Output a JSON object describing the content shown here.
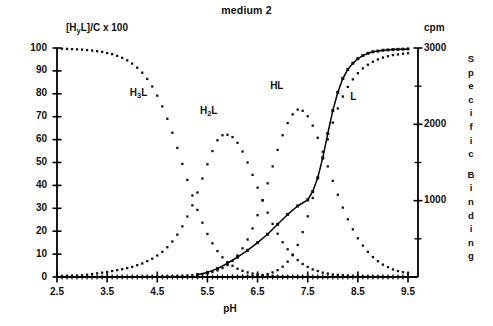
{
  "chart_data": {
    "type": "scatter",
    "title": "medium 2",
    "xlabel": "pH",
    "ylabel": "[HyL]/C x 100",
    "ylabel_parts": {
      "pre": "[H",
      "sub": "y",
      "post": "L]/C x 100"
    },
    "y2label": "cpm",
    "y2_vertical_label": "Specific Binding",
    "y2_vertical_chars": [
      "S",
      "p",
      "e",
      "c",
      "i",
      "f",
      "i",
      "c",
      "",
      "B",
      "i",
      "n",
      "d",
      "i",
      "n",
      "g"
    ],
    "xlim": [
      2.5,
      9.5
    ],
    "ylim": [
      0,
      100
    ],
    "y2lim": [
      0,
      3000
    ],
    "xticks": [
      2.5,
      3.5,
      4.5,
      5.5,
      6.5,
      7.5,
      8.5,
      9.5
    ],
    "xtick_labels": [
      "2.5",
      "3.5",
      "4.5",
      "5.5",
      "6.5",
      "7.5",
      "8.5",
      "9.5"
    ],
    "x_minor_tick_step": 0.1,
    "yticks": [
      0,
      10,
      20,
      30,
      40,
      50,
      60,
      70,
      80,
      90,
      100
    ],
    "ytick_labels": [
      "0",
      "10",
      "20",
      "30",
      "40",
      "50",
      "60",
      "70",
      "80",
      "90",
      "100"
    ],
    "y2ticks": [
      1000,
      2000,
      3000
    ],
    "y2tick_labels": [
      "1000",
      "2000",
      "3000"
    ],
    "y2_minor_ticks": [
      500,
      1500,
      2500
    ],
    "grid": false,
    "legend_position": "inline-annotations",
    "marker": "square-dot",
    "series": [
      {
        "name": "H3L",
        "label_parts": {
          "pre": "H",
          "sub": "3",
          "post": "L"
        },
        "label_x": 4.15,
        "label_y": 80,
        "style": "dotted",
        "axis": "left",
        "x": [
          2.5,
          2.6,
          2.7,
          2.8,
          2.9,
          3.0,
          3.1,
          3.2,
          3.3,
          3.4,
          3.5,
          3.6,
          3.7,
          3.8,
          3.9,
          4.0,
          4.1,
          4.2,
          4.3,
          4.4,
          4.5,
          4.6,
          4.7,
          4.8,
          4.9,
          5.0,
          5.1,
          5.2,
          5.3,
          5.4,
          5.5,
          5.6,
          5.7,
          5.8,
          5.9,
          6.0,
          6.1,
          6.2,
          6.3,
          6.4,
          6.5,
          6.6,
          6.7,
          6.8,
          6.9,
          7.0,
          7.2,
          7.4,
          7.6,
          7.8,
          8.0,
          8.5,
          9.0,
          9.5
        ],
        "y": [
          99.7,
          99.7,
          99.6,
          99.5,
          99.4,
          99.3,
          99.1,
          98.9,
          98.6,
          98.3,
          97.8,
          97.3,
          96.6,
          95.7,
          94.6,
          93.2,
          91.4,
          89.2,
          86.5,
          83.2,
          79.2,
          74.5,
          69.1,
          63.0,
          56.4,
          49.4,
          42.4,
          35.6,
          29.3,
          23.7,
          18.8,
          14.7,
          11.3,
          8.6,
          6.5,
          4.9,
          3.6,
          2.7,
          2.0,
          1.5,
          1.1,
          0.8,
          0.6,
          0.4,
          0.3,
          0.2,
          0.1,
          0.1,
          0.0,
          0.0,
          0.0,
          0.0,
          0.0,
          0.0
        ]
      },
      {
        "name": "H2L",
        "label_parts": {
          "pre": "H",
          "sub": "2",
          "post": "L"
        },
        "label_x": 5.55,
        "label_y": 72,
        "style": "dotted",
        "axis": "left",
        "x": [
          2.5,
          3.0,
          3.5,
          3.8,
          4.0,
          4.2,
          4.4,
          4.5,
          4.6,
          4.7,
          4.8,
          4.9,
          5.0,
          5.1,
          5.2,
          5.3,
          5.4,
          5.5,
          5.6,
          5.7,
          5.8,
          5.9,
          6.0,
          6.1,
          6.2,
          6.3,
          6.4,
          6.5,
          6.6,
          6.7,
          6.8,
          6.9,
          7.0,
          7.1,
          7.2,
          7.3,
          7.4,
          7.5,
          7.6,
          7.8,
          8.0,
          8.5,
          9.0,
          9.5
        ],
        "y": [
          0.3,
          0.7,
          2.2,
          3.4,
          4.4,
          5.9,
          8.0,
          9.4,
          11.0,
          13.0,
          15.5,
          18.5,
          22.1,
          26.4,
          31.3,
          36.9,
          43.0,
          49.2,
          55.0,
          59.7,
          61.9,
          62.1,
          61.1,
          58.6,
          54.8,
          50.0,
          44.6,
          39.0,
          33.4,
          28.1,
          23.2,
          18.9,
          15.2,
          12.1,
          9.5,
          7.4,
          5.7,
          4.4,
          3.3,
          1.9,
          1.1,
          0.3,
          0.1,
          0.0
        ]
      },
      {
        "name": "HL",
        "label_parts": {
          "pre": "HL",
          "sub": "",
          "post": ""
        },
        "label_x": 6.95,
        "label_y": 83,
        "style": "dotted",
        "axis": "left",
        "x": [
          2.5,
          3.5,
          4.5,
          5.0,
          5.2,
          5.4,
          5.5,
          5.6,
          5.7,
          5.8,
          5.9,
          6.0,
          6.1,
          6.2,
          6.3,
          6.4,
          6.5,
          6.6,
          6.7,
          6.8,
          6.9,
          7.0,
          7.1,
          7.2,
          7.3,
          7.4,
          7.5,
          7.6,
          7.7,
          7.8,
          7.9,
          8.0,
          8.1,
          8.2,
          8.3,
          8.4,
          8.5,
          8.6,
          8.7,
          8.8,
          8.9,
          9.0,
          9.1,
          9.2,
          9.3,
          9.4,
          9.5
        ],
        "y": [
          0.0,
          0.0,
          0.2,
          0.5,
          0.8,
          1.3,
          1.7,
          2.2,
          2.9,
          3.9,
          5.2,
          7.0,
          9.4,
          12.5,
          16.4,
          21.2,
          27.0,
          33.6,
          40.9,
          48.3,
          55.5,
          61.9,
          67.2,
          71.0,
          73.1,
          72.6,
          70.2,
          66.1,
          60.8,
          54.7,
          48.3,
          42.0,
          35.9,
          30.3,
          25.2,
          20.8,
          16.9,
          13.7,
          11.0,
          8.7,
          6.9,
          5.4,
          4.3,
          3.3,
          2.6,
          2.1,
          1.6
        ]
      },
      {
        "name": "L",
        "label_parts": {
          "pre": "L",
          "sub": "",
          "post": ""
        },
        "label_x": 8.55,
        "label_y": 78,
        "style": "dotted",
        "axis": "left",
        "x": [
          6.0,
          6.2,
          6.4,
          6.5,
          6.6,
          6.7,
          6.8,
          6.9,
          7.0,
          7.1,
          7.2,
          7.3,
          7.4,
          7.5,
          7.6,
          7.7,
          7.8,
          7.9,
          8.0,
          8.1,
          8.2,
          8.3,
          8.4,
          8.5,
          8.6,
          8.7,
          8.8,
          8.9,
          9.0,
          9.1,
          9.2,
          9.3,
          9.4,
          9.5
        ],
        "y": [
          0.1,
          0.2,
          0.4,
          0.6,
          0.9,
          1.3,
          2.0,
          3.0,
          4.5,
          6.7,
          9.8,
          14.0,
          19.6,
          26.5,
          34.5,
          43.2,
          51.9,
          60.1,
          67.4,
          73.6,
          78.8,
          83.0,
          86.3,
          89.0,
          91.1,
          92.7,
          94.0,
          95.0,
          95.8,
          96.4,
          96.9,
          97.2,
          97.5,
          97.7
        ]
      },
      {
        "name": "Specific Binding",
        "label_parts": {
          "pre": "",
          "sub": "",
          "post": ""
        },
        "style": "solid-line-with-points",
        "axis": "right",
        "x": [
          5.3,
          5.5,
          5.7,
          5.9,
          6.1,
          6.3,
          6.5,
          6.7,
          6.9,
          7.1,
          7.3,
          7.5,
          7.6,
          7.7,
          7.8,
          7.9,
          8.0,
          8.1,
          8.2,
          8.3,
          8.4,
          8.5,
          8.6,
          8.7,
          8.8,
          8.9,
          9.0,
          9.1,
          9.2,
          9.3,
          9.4,
          9.5
        ],
        "y_cpm": [
          30,
          60,
          110,
          180,
          260,
          350,
          450,
          560,
          690,
          820,
          930,
          1010,
          1120,
          1300,
          1560,
          1880,
          2180,
          2420,
          2600,
          2720,
          2800,
          2860,
          2900,
          2930,
          2950,
          2960,
          2970,
          2975,
          2980,
          2982,
          2985,
          2988
        ],
        "y_equiv_left": [
          1.0,
          2.0,
          3.7,
          6.0,
          8.7,
          11.7,
          15.0,
          18.7,
          23.0,
          27.3,
          31.0,
          33.7,
          37.3,
          43.3,
          52.0,
          62.7,
          72.7,
          80.7,
          86.7,
          90.7,
          93.3,
          95.3,
          96.7,
          97.7,
          98.3,
          98.7,
          99.0,
          99.2,
          99.3,
          99.4,
          99.5,
          99.6
        ]
      }
    ]
  },
  "plot_geometry": {
    "left_px": 57,
    "right_px": 418,
    "top_px": 48,
    "bottom_px": 277
  }
}
